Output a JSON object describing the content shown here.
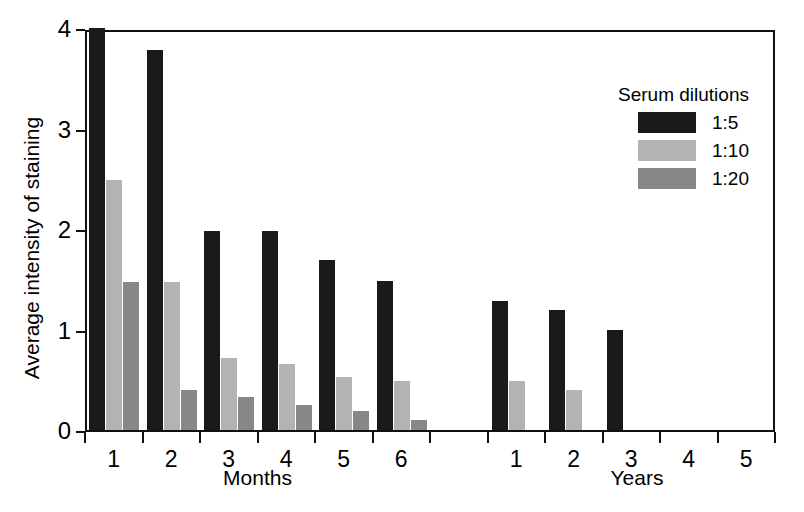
{
  "chart_data": {
    "type": "bar",
    "title": "",
    "subtitle": "",
    "xlabel": "",
    "ylabel": "Average intensity of staining",
    "ylim": [
      0,
      4
    ],
    "yticks": [
      0,
      1,
      2,
      3,
      4
    ],
    "ytick_labels": [
      "0",
      "1",
      "2",
      "3",
      "4"
    ],
    "grid": false,
    "legend_position": "top-right",
    "legend_title": "Serum dilutions",
    "group_captions": [
      "Months",
      "Years"
    ],
    "categories": [
      "1",
      "2",
      "3",
      "4",
      "5",
      "6",
      "",
      "1",
      "2",
      "3",
      "4",
      "5"
    ],
    "x_groups": [
      {
        "caption": "Months",
        "categories": [
          "1",
          "2",
          "3",
          "4",
          "5",
          "6"
        ]
      },
      {
        "caption": "Years",
        "categories": [
          "1",
          "2",
          "3",
          "4",
          "5"
        ]
      }
    ],
    "series": [
      {
        "name": "1:5",
        "color": "#1a1a1a",
        "values": [
          4.0,
          3.78,
          1.98,
          1.98,
          1.69,
          1.48,
          null,
          1.28,
          1.19,
          1.0,
          0,
          0
        ]
      },
      {
        "name": "1:10",
        "color": "#b3b3b3",
        "values": [
          2.49,
          1.47,
          0.72,
          0.66,
          0.53,
          0.49,
          null,
          0.49,
          0.4,
          0,
          0,
          0
        ]
      },
      {
        "name": "1:20",
        "color": "#878787",
        "values": [
          1.47,
          0.4,
          0.33,
          0.25,
          0.19,
          0.1,
          null,
          0,
          0,
          0,
          0,
          0
        ]
      }
    ]
  },
  "legend": {
    "title": "Serum dilutions",
    "entries": [
      {
        "label": "1:5",
        "color": "#1a1a1a"
      },
      {
        "label": "1:10",
        "color": "#b3b3b3"
      },
      {
        "label": "1:20",
        "color": "#878787"
      }
    ]
  },
  "axes": {
    "y_title": "Average intensity of staining",
    "y_tick_labels": [
      "0",
      "1",
      "2",
      "3",
      "4"
    ],
    "x_tick_labels": [
      "1",
      "2",
      "3",
      "4",
      "5",
      "6",
      "",
      "1",
      "2",
      "3",
      "4",
      "5"
    ],
    "x_group_labels": [
      "Months",
      "Years"
    ]
  }
}
